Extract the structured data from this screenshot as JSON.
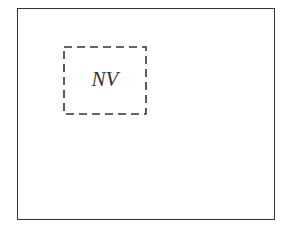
{
  "diagram": {
    "outer_box": {
      "label": ""
    },
    "inner_box": {
      "label": "NV",
      "border_style": "dashed"
    },
    "colors": {
      "stroke": "#333333",
      "background": "#ffffff"
    }
  }
}
